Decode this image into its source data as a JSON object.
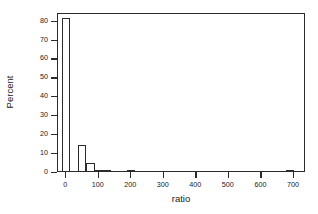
{
  "chart_data": {
    "type": "bar",
    "title": "",
    "subtitle": "",
    "xlabel": "ratio",
    "ylabel": "Percent",
    "xlim": [
      -25,
      737
    ],
    "ylim": [
      0,
      84
    ],
    "xticks": [
      0,
      100,
      200,
      300,
      400,
      500,
      600,
      700
    ],
    "xtick_labels": [
      "0",
      "100",
      "200",
      "300",
      "400",
      "500",
      "600",
      "700"
    ],
    "yticks": [
      0,
      10,
      20,
      30,
      40,
      50,
      60,
      70,
      80
    ],
    "ytick_labels": [
      "0",
      "10",
      "20",
      "30",
      "40",
      "50",
      "60",
      "70",
      "80"
    ],
    "grid": false,
    "legend": false,
    "legend_position": "none",
    "bin_width": 25,
    "bar_color": "#ffffff",
    "bar_edge_color": "#2b2b2b",
    "axis_color": "#2b2b2b",
    "bins": [
      {
        "x0": -12.5,
        "x1": 12.5,
        "center": 0,
        "value": 81.0
      },
      {
        "x0": 12.5,
        "x1": 37.5,
        "center": 25,
        "value": 0.0
      },
      {
        "x0": 37.5,
        "x1": 62.5,
        "center": 50,
        "value": 13.5
      },
      {
        "x0": 62.5,
        "x1": 87.5,
        "center": 75,
        "value": 4.0
      },
      {
        "x0": 87.5,
        "x1": 112.5,
        "center": 100,
        "value": 0.7
      },
      {
        "x0": 112.5,
        "x1": 137.5,
        "center": 125,
        "value": 0.7
      },
      {
        "x0": 187.5,
        "x1": 212.5,
        "center": 200,
        "value": 0.7
      },
      {
        "x0": 675.0,
        "x1": 700.0,
        "center": 687,
        "value": 0.7
      }
    ],
    "categories": [
      "0",
      "25",
      "50",
      "75",
      "100",
      "125",
      "200",
      "687"
    ],
    "values": [
      81.0,
      0.0,
      13.5,
      4.0,
      0.7,
      0.7,
      0.7,
      0.7
    ]
  }
}
